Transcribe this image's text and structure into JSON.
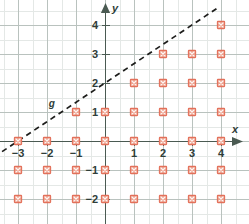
{
  "chart_data": {
    "type": "scatter",
    "title": "",
    "xlabel": "x",
    "ylabel": "y",
    "xlim": [
      -3.55,
      4.35
    ],
    "ylim": [
      -2.6,
      4.6
    ],
    "xticks": [
      -3,
      -2,
      -1,
      1,
      2,
      3,
      4
    ],
    "yticks": [
      -2,
      -1,
      1,
      2,
      3,
      4
    ],
    "xtick_labels": [
      "−3",
      "−2",
      "−1",
      "1",
      "2",
      "3",
      "4"
    ],
    "ytick_labels": [
      "−2",
      "−1",
      "1",
      "2",
      "3",
      "4"
    ],
    "grid": true,
    "grid_minor_step": 0.5,
    "grid_major_step": 1,
    "legend": "none",
    "series": [
      {
        "name": "g",
        "type": "line",
        "style": "dashed",
        "label": "g",
        "label_x": -1.8,
        "label_y": 1.27,
        "slope": 0.6667,
        "intercept": 2,
        "equation": "y = 2/3 x + 2",
        "x_endpoints": [
          -3.55,
          3.9
        ],
        "y_endpoints": [
          -0.367,
          4.6
        ],
        "color": "#1d1d1b"
      },
      {
        "name": "solution-points",
        "type": "scatter",
        "marker": "square-x",
        "color": "#e3705a",
        "points": [
          [
            -3,
            0
          ],
          [
            -2,
            0
          ],
          [
            -1,
            0
          ],
          [
            0,
            0
          ],
          [
            1,
            0
          ],
          [
            2,
            0
          ],
          [
            3,
            0
          ],
          [
            4,
            0
          ],
          [
            -3,
            -1
          ],
          [
            -2,
            -1
          ],
          [
            -1,
            -1
          ],
          [
            0,
            -1
          ],
          [
            1,
            -1
          ],
          [
            2,
            -1
          ],
          [
            3,
            -1
          ],
          [
            4,
            -1
          ],
          [
            -3,
            -2
          ],
          [
            -2,
            -2
          ],
          [
            -1,
            -2
          ],
          [
            0,
            -2
          ],
          [
            1,
            -2
          ],
          [
            2,
            -2
          ],
          [
            3,
            -2
          ],
          [
            4,
            -2
          ],
          [
            -1,
            1
          ],
          [
            0,
            1
          ],
          [
            1,
            1
          ],
          [
            2,
            1
          ],
          [
            3,
            1
          ],
          [
            4,
            1
          ],
          [
            1,
            2
          ],
          [
            2,
            2
          ],
          [
            3,
            2
          ],
          [
            4,
            2
          ],
          [
            2,
            3
          ],
          [
            3,
            3
          ],
          [
            4,
            3
          ],
          [
            4,
            4
          ]
        ]
      }
    ]
  },
  "axes": {
    "x_axis_label": "x",
    "y_axis_label": "y",
    "origin_px": [
      105,
      141
    ],
    "unit_px": 29
  },
  "colors": {
    "marker": "#e3705a",
    "axis": "#4a5a52",
    "grid_major": "#b9c2be",
    "grid_minor": "#e4e8e6",
    "line": "#1d1d1b",
    "text": "#2f3d38",
    "background": "#ffffff"
  }
}
